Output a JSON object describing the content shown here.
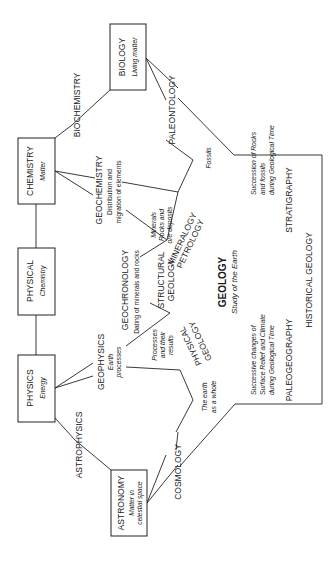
{
  "diagram": {
    "boxes": {
      "biology": {
        "title": "BIOLOGY",
        "subtitle": "Living matter"
      },
      "chemistry": {
        "title": "CHEMISTRY",
        "subtitle": "Matter"
      },
      "physical": {
        "title": "PHYSICAL",
        "subtitle": "Chemistry"
      },
      "physics": {
        "title": "PHYSICS",
        "subtitle": "Energy"
      },
      "astronomy": {
        "title": "ASTRONOMY",
        "subtitle_1": "Matter in",
        "subtitle_2": "celestial space"
      }
    },
    "links": {
      "biochemistry": "BIOCHEMISTRY",
      "paleontology": "PALEONTOLOGY",
      "fossils": "Fossils",
      "geochemistry": "GEOCHEMISTRY",
      "geochemistry_desc_1": "Distribution and",
      "geochemistry_desc_2": "migration of elements",
      "minerals_1": "Minerals",
      "minerals_2": "Rocks and",
      "minerals_3": "ore deposits",
      "mineralogy": "MINERALOGY",
      "petrology": "PETROLOGY",
      "geochronology": "GEOCHRONOLOGY",
      "geochronology_desc": "Dating of minerals and rocks",
      "structural_1": "STRUCTURAL",
      "structural_2": "GEOLOGY",
      "geophysics": "GEOPHYSICS",
      "geophysics_desc_1": "Earth",
      "geophysics_desc_2": "processes",
      "processes_1": "Processes",
      "processes_2": "and their",
      "processes_3": "results",
      "physical_geology_1": "PHYSICAL",
      "physical_geology_2": "GEOLOGY",
      "earth_whole_1": "The earth",
      "earth_whole_2": "as a whole",
      "astrophysics": "ASTROPHYSICS",
      "cosmology": "COSMOLOGY"
    },
    "geology": {
      "title": "GEOLOGY",
      "subtitle": "Study of the Earth",
      "strat_desc_1": "Succession of Rocks",
      "strat_desc_2": "and fossils",
      "strat_desc_3": "during Geological Time",
      "stratigraphy": "STRATIGRAPHY",
      "paleo_desc_1": "Successive changes of",
      "paleo_desc_2": "Surface Relief and Climate",
      "paleo_desc_3": "during Geological Time",
      "paleogeography": "PALEOGEOGRAPHY",
      "historical": "HISTORICAL GEOLOGY"
    }
  }
}
